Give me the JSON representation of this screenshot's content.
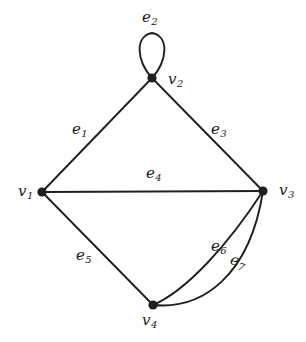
{
  "figure": {
    "type": "undirected-multigraph-diagram",
    "background_color": "#ffffff",
    "ink_color": "#231f20",
    "width": 306,
    "height": 342
  },
  "graph": {
    "vertices": [
      {
        "id": "v1",
        "name": "v",
        "sub": "1",
        "x": 42,
        "y": 192,
        "label_x": 18,
        "label_y": 184
      },
      {
        "id": "v2",
        "name": "v",
        "sub": "2",
        "x": 152,
        "y": 78,
        "label_x": 168,
        "label_y": 72
      },
      {
        "id": "v3",
        "name": "v",
        "sub": "3",
        "x": 263,
        "y": 191,
        "label_x": 279,
        "label_y": 183
      },
      {
        "id": "v4",
        "name": "v",
        "sub": "4",
        "x": 153,
        "y": 305,
        "label_x": 142,
        "label_y": 313
      }
    ],
    "edges": [
      {
        "id": "e1",
        "name": "e",
        "sub": "1",
        "from": "v1",
        "to": "v2",
        "shape": "straight",
        "label_x": 72,
        "label_y": 122
      },
      {
        "id": "e2",
        "name": "e",
        "sub": "2",
        "from": "v2",
        "to": "v2",
        "shape": "self-loop",
        "label_x": 142,
        "label_y": 10
      },
      {
        "id": "e3",
        "name": "e",
        "sub": "3",
        "from": "v2",
        "to": "v3",
        "shape": "straight",
        "label_x": 211,
        "label_y": 122
      },
      {
        "id": "e4",
        "name": "e",
        "sub": "4",
        "from": "v1",
        "to": "v3",
        "shape": "straight",
        "label_x": 146,
        "label_y": 166
      },
      {
        "id": "e5",
        "name": "e",
        "sub": "5",
        "from": "v1",
        "to": "v4",
        "shape": "straight",
        "label_x": 76,
        "label_y": 248
      },
      {
        "id": "e6",
        "name": "e",
        "sub": "6",
        "from": "v4",
        "to": "v3",
        "shape": "curve-inner",
        "label_x": 211,
        "label_y": 239
      },
      {
        "id": "e7",
        "name": "e",
        "sub": "7",
        "from": "v4",
        "to": "v3",
        "shape": "curve-outer",
        "label_x": 233,
        "label_y": 258
      }
    ],
    "counts": {
      "vertices": 4,
      "edges": 7,
      "loops": 1,
      "parallel_pairs": 1
    }
  }
}
